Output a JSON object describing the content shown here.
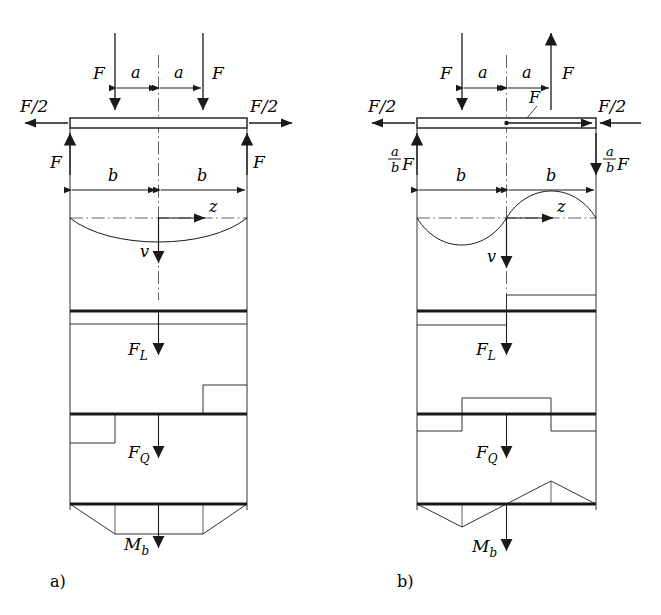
{
  "figure": {
    "background": "#ffffff",
    "ink": "#1a1a1a",
    "width": 661,
    "height": 615,
    "type": "engineering-beam-diagram"
  },
  "panels": [
    {
      "id": "a",
      "caption": "a)",
      "beam": {
        "left": 70,
        "right": 247,
        "top": 118,
        "bottom": 128,
        "mid": 158.5
      },
      "top_forces": {
        "left_load_label": "F",
        "right_load_label": "F",
        "left_load_direction": "down",
        "right_load_direction": "down",
        "left_end_label": "F/2",
        "right_end_label": "F/2",
        "left_end_direction": "left",
        "right_end_direction": "right"
      },
      "reactions": {
        "left_label": "F",
        "right_label": "F",
        "left_direction": "up",
        "right_direction": "up"
      },
      "dimensions": {
        "a_left": "a",
        "a_right": "a",
        "b_left": "b",
        "b_right": "b"
      },
      "axes": {
        "z_label": "z",
        "v_label": "v"
      },
      "deflection_shape": "single-sag",
      "diagrams": [
        {
          "label": "F_L",
          "label_main": "F",
          "label_sub": "L",
          "shape": "uniform-negative-full-span"
        },
        {
          "label": "F_Q",
          "label_main": "F",
          "label_sub": "Q",
          "shape": "step-negative-left-positive-right"
        },
        {
          "label": "M_b",
          "label_main": "M",
          "label_sub": "b",
          "shape": "trapezoid-below"
        }
      ]
    },
    {
      "id": "b",
      "caption": "b)",
      "beam": {
        "left": 417,
        "right": 596,
        "top": 118,
        "bottom": 128,
        "mid": 506.5
      },
      "top_forces": {
        "left_load_label": "F",
        "right_load_label": "F",
        "left_load_direction": "down",
        "right_load_direction": "up",
        "left_end_label": "F/2",
        "right_end_label": "F/2",
        "left_end_direction": "left",
        "right_end_direction": "left",
        "inline_axial_label": "F",
        "inline_axial_direction": "right"
      },
      "reactions": {
        "left_label_numerator": "a",
        "left_label_denominator": "b",
        "left_label_factor": "F",
        "right_label_numerator": "a",
        "right_label_denominator": "b",
        "right_label_factor": "F",
        "left_direction": "up",
        "right_direction": "down"
      },
      "dimensions": {
        "a_left": "a",
        "a_right": "a",
        "b_left": "b",
        "b_right": "b"
      },
      "axes": {
        "z_label": "z",
        "v_label": "v"
      },
      "deflection_shape": "full-sine-antisymmetric",
      "diagrams": [
        {
          "label": "F_L",
          "label_main": "F",
          "label_sub": "L",
          "shape": "step-negative-left-positive-right"
        },
        {
          "label": "F_Q",
          "label_main": "F",
          "label_sub": "Q",
          "shape": "negative-outer-positive-middle"
        },
        {
          "label": "M_b",
          "label_main": "M",
          "label_sub": "b",
          "shape": "antisymmetric-triangles"
        }
      ]
    }
  ]
}
